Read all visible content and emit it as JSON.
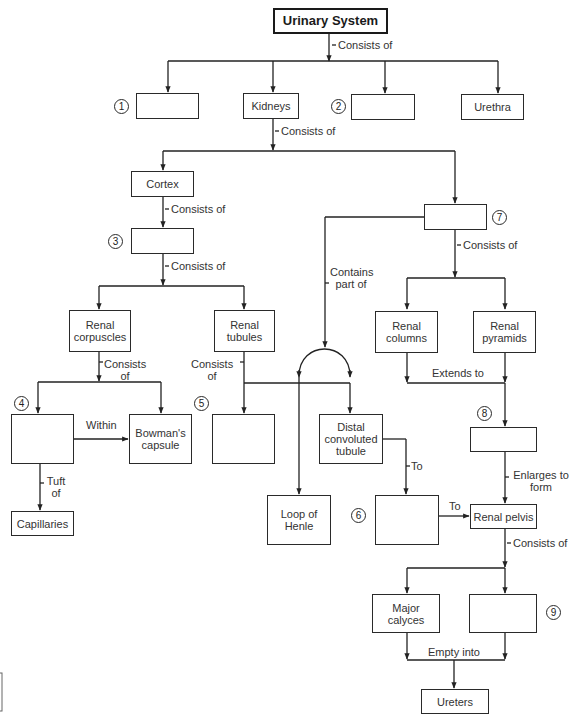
{
  "diagram": {
    "title": "Urinary System",
    "nodes": {
      "urinary_system": "Urinary System",
      "blank_1": "",
      "kidneys": "Kidneys",
      "blank_2": "",
      "urethra": "Urethra",
      "cortex": "Cortex",
      "blank_3": "",
      "blank_7": "",
      "renal_corpuscles": "Renal corpuscles",
      "renal_tubules": "Renal tubules",
      "renal_columns": "Renal columns",
      "renal_pyramids": "Renal pyramids",
      "blank_4": "",
      "bowmans_capsule": "Bowman's capsule",
      "blank_5": "",
      "distal_convoluted_tubule": "Distal convoluted tubule",
      "blank_8": "",
      "capillaries": "Capillaries",
      "loop_of_henle": "Loop of Henle",
      "blank_6": "",
      "renal_pelvis": "Renal pelvis",
      "major_calyces": "Major calyces",
      "blank_9": "",
      "ureters": "Ureters"
    },
    "markers": [
      "1",
      "2",
      "3",
      "4",
      "5",
      "6",
      "7",
      "8",
      "9"
    ],
    "edge_labels": {
      "system_consists_of": "Consists of",
      "kidneys_consists_of": "Consists of",
      "cortex_consists_of": "Consists of",
      "blank3_consists_of": "Consists of",
      "blank7_consists_of": "Consists of",
      "contains_part_of": "Contains part of",
      "corpuscles_consists_of": "Consists of",
      "tubules_consists_of": "Consists of",
      "extends_to": "Extends to",
      "within": "Within",
      "tuft_of": "Tuft of",
      "to_1": "To",
      "to_2": "To",
      "enlarges_to_form": "Enlarges to form",
      "pelvis_consists_of": "Consists of",
      "empty_into": "Empty into"
    }
  }
}
